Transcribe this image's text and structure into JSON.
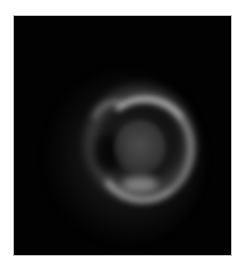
{
  "image": {
    "description": "Grayscale microscopy-style image of a glowing ring structure on a black background",
    "colors": {
      "background": "#020202",
      "border": "#bdbdbd",
      "ring_highlight": "#d7d7d7",
      "inner_disk": "#5a5a5a"
    }
  }
}
